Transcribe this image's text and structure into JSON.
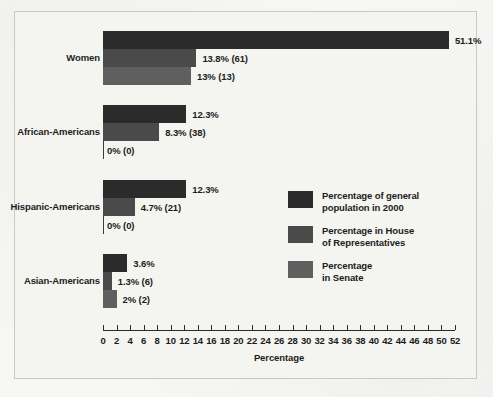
{
  "chart_data": {
    "type": "bar",
    "orientation": "horizontal",
    "title": "",
    "xlabel": "Percentage",
    "ylabel": "",
    "xlim": [
      0,
      52
    ],
    "xticks": [
      0,
      2,
      4,
      6,
      8,
      10,
      12,
      14,
      16,
      18,
      20,
      22,
      24,
      26,
      28,
      30,
      32,
      34,
      36,
      38,
      40,
      42,
      44,
      46,
      48,
      50,
      52
    ],
    "grid": false,
    "legend_position": "center-right",
    "categories": [
      "Women",
      "African-Americans",
      "Hispanic-Americans",
      "Asian-Americans"
    ],
    "series": [
      {
        "name": "Percentage of general population in 2000",
        "values": [
          51.1,
          12.3,
          12.3,
          3.6
        ],
        "labels": [
          "51.1%",
          "12.3%",
          "12.3%",
          "3.6%"
        ],
        "color": "#2b2b2b"
      },
      {
        "name": "Percentage in House of Representatives",
        "values": [
          13.8,
          8.3,
          4.7,
          1.3
        ],
        "counts": [
          61,
          38,
          21,
          6
        ],
        "labels": [
          "13.8% (61)",
          "8.3% (38)",
          "4.7% (21)",
          "1.3% (6)"
        ],
        "color": "#4a4a4a"
      },
      {
        "name": "Percentage in Senate",
        "values": [
          13,
          0,
          0,
          2
        ],
        "counts": [
          13,
          0,
          0,
          2
        ],
        "labels": [
          "13% (13)",
          "0% (0)",
          "0% (0)",
          "2% (2)"
        ],
        "color": "#5f5f5f"
      }
    ]
  },
  "legend": {
    "entries": [
      {
        "label": "Percentage of general\npopulation in 2000",
        "color": "#2b2b2b"
      },
      {
        "label": "Percentage in House\nof Representatives",
        "color": "#4a4a4a"
      },
      {
        "label": "Percentage\nin Senate",
        "color": "#5f5f5f"
      }
    ]
  },
  "axis": {
    "title": "Percentage"
  }
}
